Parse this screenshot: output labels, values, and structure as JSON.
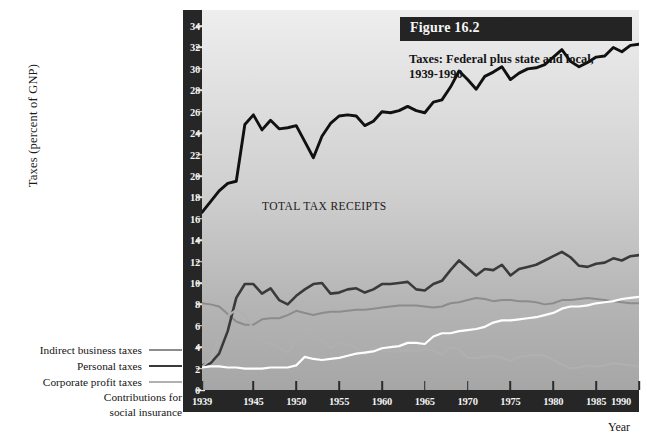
{
  "figure": {
    "number_label": "Figure 16.2"
  },
  "axes": {
    "y_caption": "Taxes (percent of GNP)",
    "x_caption": "Year",
    "y_ticks": [
      0,
      2,
      4,
      6,
      8,
      10,
      12,
      14,
      16,
      18,
      20,
      22,
      24,
      26,
      28,
      30,
      32,
      34
    ],
    "x_ticks": [
      1939,
      1945,
      1950,
      1955,
      1960,
      1965,
      1970,
      1975,
      1980,
      1985,
      1990
    ]
  },
  "annotation": {
    "total_tax_receipts": "TOTAL TAX RECEIPTS"
  },
  "legend": {
    "items": [
      {
        "label": "Indirect business taxes",
        "color": "#8c8c8c",
        "width": 2.0,
        "swatch": true
      },
      {
        "label": "Personal taxes",
        "color": "#3a3a3a",
        "width": 2.6,
        "swatch": true
      },
      {
        "label": "Corporate profit taxes",
        "color": "#b0b0b0",
        "width": 2.0,
        "swatch": true
      },
      {
        "label": "Contributions for\nsocial insurance",
        "color": "#ffffff",
        "width": 2.2,
        "swatch": false
      }
    ]
  },
  "colors": {
    "axis_band": "#262626",
    "title_box": "#242424",
    "plot_top": "#eeeeee",
    "plot_bottom": "#a6a6a6",
    "total_line": "#111111",
    "indirect_line": "#8c8c8c",
    "personal_line": "#3a3a3a",
    "corporate_line": "#b0b0b0",
    "social_line": "#ffffff"
  },
  "chart_data": {
    "type": "line",
    "subtitle": "Figure 16.2",
    "xlabel": "Year",
    "ylabel": "Taxes (percent of GNP)",
    "xlim": [
      1939,
      1990
    ],
    "ylim": [
      0,
      35.5
    ],
    "grid": false,
    "legend_position": "outside-left-bottom",
    "x": [
      1939,
      1940,
      1941,
      1942,
      1943,
      1944,
      1945,
      1946,
      1947,
      1948,
      1949,
      1950,
      1951,
      1952,
      1953,
      1954,
      1955,
      1956,
      1957,
      1958,
      1959,
      1960,
      1961,
      1962,
      1963,
      1964,
      1965,
      1966,
      1967,
      1968,
      1969,
      1970,
      1971,
      1972,
      1973,
      1974,
      1975,
      1976,
      1977,
      1978,
      1979,
      1980,
      1981,
      1982,
      1983,
      1984,
      1985,
      1986,
      1987,
      1988,
      1989,
      1990
    ],
    "series": [
      {
        "name": "TOTAL TAX RECEIPTS",
        "color": "#111111",
        "width": 2.9,
        "values": [
          16.6,
          17.6,
          18.6,
          19.3,
          19.5,
          24.8,
          25.7,
          24.3,
          25.2,
          24.4,
          24.5,
          24.7,
          23.2,
          21.7,
          23.7,
          24.9,
          25.6,
          25.7,
          25.6,
          24.7,
          25.1,
          26.0,
          25.9,
          26.1,
          26.5,
          26.1,
          25.9,
          26.9,
          27.1,
          28.3,
          29.8,
          29.0,
          28.1,
          29.3,
          29.7,
          30.2,
          29.0,
          29.6,
          30.0,
          30.1,
          30.4,
          31.1,
          31.8,
          30.7,
          30.2,
          30.6,
          31.1,
          31.2,
          32.0,
          31.6,
          32.2,
          32.3
        ]
      },
      {
        "name": "Indirect business taxes",
        "color": "#8c8c8c",
        "width": 2.0,
        "values": [
          8.1,
          8.0,
          7.8,
          7.1,
          6.4,
          6.1,
          6.1,
          6.6,
          6.7,
          6.7,
          7.0,
          7.4,
          7.2,
          7.0,
          7.2,
          7.3,
          7.3,
          7.4,
          7.5,
          7.5,
          7.6,
          7.7,
          7.8,
          7.9,
          7.9,
          7.9,
          7.8,
          7.7,
          7.8,
          8.1,
          8.2,
          8.4,
          8.6,
          8.5,
          8.3,
          8.4,
          8.4,
          8.3,
          8.3,
          8.2,
          8.0,
          8.1,
          8.4,
          8.4,
          8.5,
          8.6,
          8.5,
          8.4,
          8.3,
          8.2,
          8.1,
          8.1
        ]
      },
      {
        "name": "Personal taxes",
        "color": "#3a3a3a",
        "width": 2.6,
        "values": [
          2.3,
          2.5,
          3.4,
          5.5,
          8.6,
          9.9,
          9.9,
          9.0,
          9.5,
          8.4,
          8.0,
          8.8,
          9.4,
          9.9,
          10.0,
          9.0,
          9.1,
          9.4,
          9.5,
          9.1,
          9.4,
          9.9,
          9.9,
          10.0,
          10.1,
          9.4,
          9.3,
          9.9,
          10.2,
          11.2,
          12.1,
          11.4,
          10.7,
          11.3,
          11.2,
          11.7,
          10.7,
          11.3,
          11.5,
          11.7,
          12.1,
          12.5,
          12.9,
          12.4,
          11.6,
          11.5,
          11.8,
          11.9,
          12.3,
          12.1,
          12.5,
          12.6
        ]
      },
      {
        "name": "Corporate profit taxes",
        "color": "#b0b0b0",
        "width": 2.0,
        "values": [
          2.2,
          2.8,
          5.0,
          6.9,
          7.5,
          7.0,
          5.7,
          4.5,
          4.3,
          4.0,
          3.5,
          4.6,
          5.4,
          4.9,
          4.7,
          3.9,
          4.4,
          4.3,
          4.0,
          3.3,
          4.0,
          3.7,
          3.6,
          3.6,
          3.7,
          3.6,
          3.8,
          3.7,
          3.3,
          4.0,
          3.8,
          3.0,
          3.0,
          3.1,
          3.2,
          3.0,
          2.7,
          3.1,
          3.2,
          3.3,
          3.2,
          2.8,
          2.4,
          2.0,
          2.1,
          2.3,
          2.2,
          2.3,
          2.5,
          2.4,
          2.3,
          2.2
        ]
      },
      {
        "name": "Contributions for social insurance",
        "color": "#ffffff",
        "width": 2.2,
        "values": [
          2.1,
          2.2,
          2.2,
          2.1,
          2.1,
          2.0,
          2.0,
          2.0,
          2.1,
          2.1,
          2.1,
          2.3,
          3.1,
          2.9,
          2.8,
          2.9,
          3.0,
          3.2,
          3.4,
          3.5,
          3.6,
          3.9,
          4.0,
          4.1,
          4.4,
          4.4,
          4.3,
          5.0,
          5.3,
          5.3,
          5.5,
          5.6,
          5.7,
          5.9,
          6.3,
          6.5,
          6.5,
          6.6,
          6.7,
          6.8,
          7.0,
          7.2,
          7.6,
          7.8,
          7.8,
          7.9,
          8.1,
          8.2,
          8.3,
          8.5,
          8.6,
          8.7
        ]
      }
    ]
  }
}
